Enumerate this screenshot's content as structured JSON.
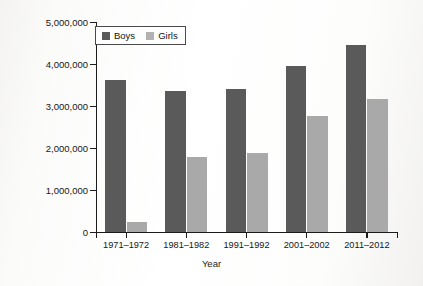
{
  "chart_data": {
    "type": "bar",
    "title": "",
    "xlabel": "Year",
    "ylabel": "Participation Numbers",
    "categories": [
      "1971–1972",
      "1981–1982",
      "1991–1992",
      "2001–2002",
      "2011–2012"
    ],
    "series": [
      {
        "name": "Boys",
        "color": "#5a5a5a",
        "values": [
          3620000,
          3360000,
          3400000,
          3950000,
          4450000
        ]
      },
      {
        "name": "Girls",
        "color": "#a9a9a9",
        "values": [
          250000,
          1790000,
          1890000,
          2770000,
          3170000
        ]
      }
    ],
    "ylim": [
      0,
      5000000
    ],
    "ytick_labels": [
      "0",
      "1,000,000",
      "2,000,000",
      "3,000,000",
      "4,000,000",
      "5,000,000"
    ],
    "ytick_values": [
      0,
      1000000,
      2000000,
      3000000,
      4000000,
      5000000
    ],
    "grid": false,
    "legend_position": "top-left"
  },
  "legend": {
    "entries": [
      {
        "label": "Boys"
      },
      {
        "label": "Girls"
      }
    ]
  }
}
